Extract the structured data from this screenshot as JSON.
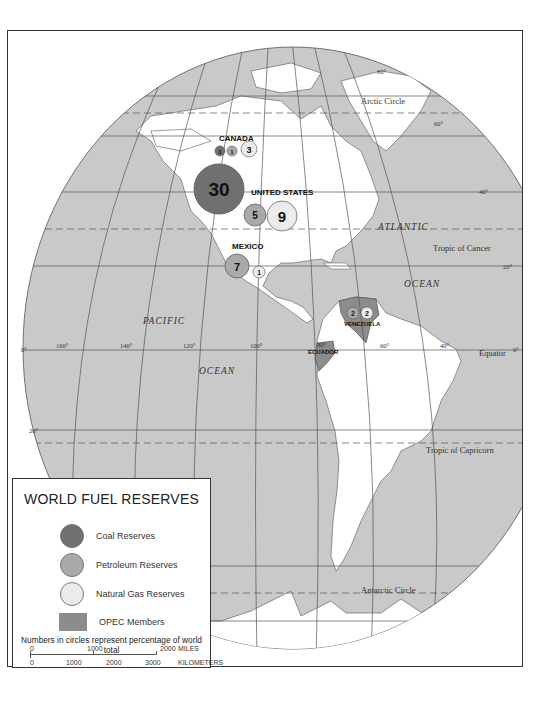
{
  "legend": {
    "title": "WORLD FUEL RESERVES",
    "items": [
      {
        "label": "Coal Reserves",
        "color": "#707070",
        "shape": "circle"
      },
      {
        "label": "Petroleum Reserves",
        "color": "#a9a9a9",
        "shape": "circle"
      },
      {
        "label": "Natural Gas Reserves",
        "color": "#ebebeb",
        "shape": "circle"
      },
      {
        "label": "OPEC Members",
        "color": "#8c8c8c",
        "shape": "rectangle"
      }
    ],
    "note": "Numbers in circles represent percentage of world total",
    "scale": {
      "miles_ticks": [
        "0",
        "1000",
        "2000"
      ],
      "miles_unit": "MILES",
      "km_ticks": [
        "0",
        "1000",
        "2000",
        "3000"
      ],
      "km_unit": "KILOMETERS"
    }
  },
  "map": {
    "ocean_color": "#c9c9c9",
    "land_color": "#ffffff",
    "opec_color": "#8c8c8c",
    "countries": {
      "canada": {
        "label": "CANADA",
        "coal": "1",
        "petroleum": "1",
        "natural_gas": "3"
      },
      "united_states": {
        "label": "UNITED STATES",
        "coal": "30",
        "petroleum": "5",
        "natural_gas": "9"
      },
      "mexico": {
        "label": "MEXICO",
        "petroleum": "7",
        "natural_gas": "1"
      },
      "venezuela": {
        "label": "VENEZUELA",
        "petroleum": "2",
        "natural_gas": "2"
      },
      "ecuador": {
        "label": "ECUADOR"
      }
    },
    "oceans": {
      "pacific_1": "PACIFIC",
      "pacific_2": "OCEAN",
      "atlantic_1": "ATLANTIC",
      "atlantic_2": "OCEAN"
    },
    "lines": {
      "arctic_circle": "Arctic Circle",
      "tropic_cancer": "Tropic of Cancer",
      "equator": "Equator",
      "tropic_capricorn": "Tropic of Capricorn",
      "antarctic_circle": "Antarctic Circle"
    },
    "lat_labels": {
      "lat80": "80°",
      "lat60": "60°",
      "lat40": "40°",
      "lat20n": "20°",
      "lat0_left": "0°",
      "lat0_right": "0°",
      "lat20s": "20°"
    },
    "lon_labels": {
      "lon160": "160°",
      "lon140": "140°",
      "lon120": "120°",
      "lon100": "100°",
      "lon80": "80°",
      "lon60": "60°",
      "lon40": "40°"
    }
  }
}
